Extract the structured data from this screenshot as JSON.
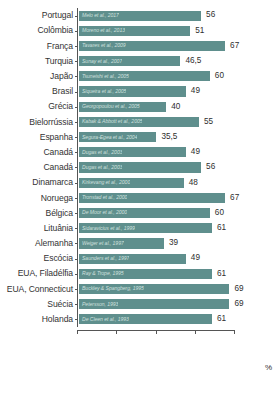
{
  "chart_data": {
    "type": "bar",
    "orientation": "horizontal",
    "title": "",
    "xlabel": "%",
    "ylabel": "",
    "xlim": [
      0,
      72
    ],
    "grid": false,
    "legend": null,
    "value_decimal_separator": ",",
    "axis_tick_labels": [],
    "axis_tick_positions": [
      0,
      18,
      36,
      54,
      72
    ],
    "categories": [
      "Portugal",
      "Colômbia",
      "França",
      "Turquia",
      "Japão",
      "Brasil",
      "Grécia",
      "Bielorrússia",
      "Espanha",
      "Canadá",
      "Canadá",
      "Dinamarca",
      "Noruega",
      "Bélgica",
      "Lituânia",
      "Alemanha",
      "Escócia",
      "EUA, Filadélfia",
      "EUA, Connecticut",
      "Suécia",
      "Holanda"
    ],
    "values": [
      56,
      51,
      67,
      46.5,
      60,
      49,
      40,
      55,
      35.5,
      49,
      56,
      48,
      67,
      60,
      61,
      39,
      49,
      61,
      69,
      69,
      61
    ],
    "value_labels": [
      "56",
      "51",
      "67",
      "46,5",
      "60",
      "49",
      "40",
      "55",
      "35,5",
      "49",
      "56",
      "48",
      "67",
      "60",
      "61",
      "39",
      "49",
      "61",
      "69",
      "69",
      "61"
    ],
    "annotations": [
      "Melo et al., 2017",
      "Moreno et al., 2013",
      "Tavares et al., 2009",
      "Sunay et al., 2007",
      "Tsuneishi et al., 2005",
      "Siqueira et al., 2005",
      "Georgopoulou et al., 2005",
      "Kabak & Abbott et al., 2005",
      "Segura-Egea et al., 2004",
      "Dugas et al., 2003",
      "Dugas et al., 2003",
      "Kirkevang et al., 2000",
      "Tronstad et al., 2000",
      "De Moor et al., 2000",
      "Sidaravicius et al., 1999",
      "Weiger et al., 1997",
      "Saunders et al., 1997",
      "Ray & Trope, 1995",
      "Buckley & Spangberg, 1995",
      "Petersson, 1993",
      "De Cleen et al., 1993"
    ],
    "colors": {
      "bar": "#5f8f8d",
      "citation_text": "#cfe0df",
      "value_text": "#2e2e2e",
      "axis": "#555555",
      "background": "#ffffff"
    }
  }
}
